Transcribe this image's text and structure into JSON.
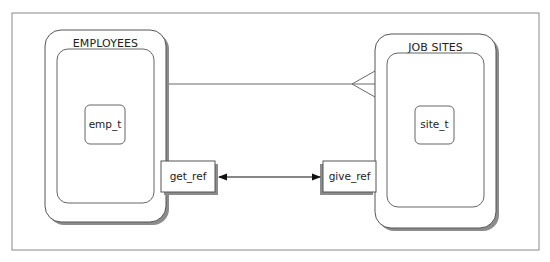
{
  "diagram": {
    "entities": [
      {
        "id": "employees",
        "title": "EMPLOYEES",
        "type_label": "emp_t",
        "method_label": "get_ref"
      },
      {
        "id": "job_sites",
        "title": "JOB SITES",
        "type_label": "site_t",
        "method_label": "give_ref"
      }
    ],
    "relationships": [
      {
        "from": "EMPLOYEES",
        "to": "JOB SITES",
        "notation": "crow's foot",
        "cardinality": "one-to-many"
      },
      {
        "from": "get_ref",
        "to": "give_ref",
        "notation": "bidirectional arrow"
      }
    ],
    "colors": {
      "line": "#555555",
      "shadow": "#8c8c8c",
      "frame": "#8a8a8a",
      "fill": "#ffffff"
    }
  }
}
